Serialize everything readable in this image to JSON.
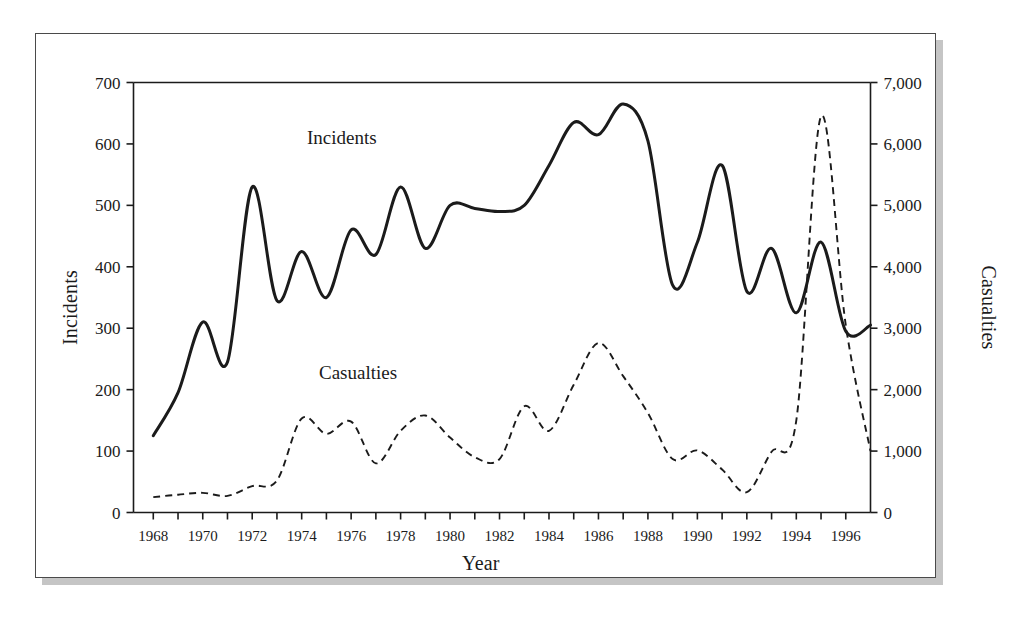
{
  "figure": {
    "series_labels": {
      "incidents": "Incidents",
      "casualties": "Casualties"
    },
    "axis_titles": {
      "x": "Year",
      "y_left": "Incidents",
      "y_right": "Casualties"
    },
    "colors": {
      "line": "#1b1b1b",
      "frame": "#4a4a4a",
      "background": "#ffffff",
      "shadow": "#969696"
    }
  },
  "chart_data": {
    "type": "line",
    "title": "",
    "xlabel": "Year",
    "ylabel": "Incidents",
    "y2label": "Casualties",
    "grid": false,
    "legend": "inline-labels",
    "xlim": [
      1967.2,
      1997.0
    ],
    "ylim": [
      0,
      700
    ],
    "y2lim": [
      0,
      7000
    ],
    "x_tick_step_minor": 1,
    "x_tick_step_major": 2,
    "xticks": [
      1968,
      1970,
      1972,
      1974,
      1976,
      1978,
      1980,
      1982,
      1984,
      1986,
      1988,
      1990,
      1992,
      1994,
      1996
    ],
    "xticklabels": [
      "1968",
      "1970",
      "1972",
      "1974",
      "1976",
      "1978",
      "1980",
      "1982",
      "1984",
      "1986",
      "1988",
      "1990",
      "1992",
      "1994",
      "1996"
    ],
    "yticks": [
      0,
      100,
      200,
      300,
      400,
      500,
      600,
      700
    ],
    "yticklabels": [
      "0",
      "100",
      "200",
      "300",
      "400",
      "500",
      "600",
      "700"
    ],
    "y2ticks": [
      0,
      1000,
      2000,
      3000,
      4000,
      5000,
      6000,
      7000
    ],
    "y2ticklabels": [
      "0",
      "1,000",
      "2,000",
      "3,000",
      "4,000",
      "5,000",
      "6,000",
      "7,000"
    ],
    "x": [
      1968,
      1969,
      1970,
      1971,
      1972,
      1973,
      1974,
      1975,
      1976,
      1977,
      1978,
      1979,
      1980,
      1981,
      1982,
      1983,
      1984,
      1985,
      1986,
      1987,
      1988,
      1989,
      1990,
      1991,
      1992,
      1993,
      1994,
      1995,
      1996,
      1997
    ],
    "series": [
      {
        "name": "Incidents",
        "axis": "left",
        "style": "solid",
        "values": [
          125,
          195,
          310,
          245,
          530,
          345,
          425,
          350,
          460,
          420,
          530,
          430,
          500,
          495,
          490,
          500,
          565,
          635,
          615,
          665,
          605,
          370,
          440,
          565,
          360,
          430,
          325,
          440,
          295,
          305
        ]
      },
      {
        "name": "Casualties",
        "axis": "right",
        "style": "dashed",
        "values": [
          250,
          290,
          320,
          270,
          430,
          520,
          1530,
          1280,
          1480,
          800,
          1330,
          1580,
          1220,
          900,
          870,
          1730,
          1330,
          2080,
          2760,
          2220,
          1620,
          870,
          1010,
          700,
          330,
          990,
          1500,
          6450,
          3050,
          1000
        ]
      }
    ]
  }
}
